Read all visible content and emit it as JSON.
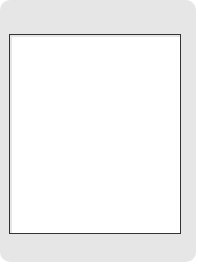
{
  "top_file_labels": [
    "1",
    "2",
    "3",
    "4",
    "5",
    "6",
    "7",
    "8",
    "9"
  ],
  "bottom_file_labels": [
    "九",
    "八",
    "七",
    "六",
    "五",
    "四",
    "三",
    "二",
    "一"
  ],
  "colors": {
    "black_piece": "#151515",
    "red_piece": "#7a7a7a",
    "frame": "#e6e6e6",
    "board": "#ffffff"
  },
  "pieces": [
    {
      "side": "black",
      "label": "将",
      "col": 4,
      "row": 0
    },
    {
      "side": "black",
      "label": "士",
      "col": 6,
      "row": 0
    },
    {
      "side": "black",
      "label": "炮",
      "col": 4,
      "row": 1
    },
    {
      "side": "black",
      "label": "士",
      "col": 5,
      "row": 1
    },
    {
      "side": "black",
      "label": "炮",
      "col": 6,
      "row": 1
    },
    {
      "side": "red",
      "label": "马",
      "col": 7,
      "row": 1
    },
    {
      "side": "black",
      "label": "车",
      "col": 2,
      "row": 2
    },
    {
      "side": "red",
      "label": "车",
      "col": 4,
      "row": 3
    },
    {
      "side": "red",
      "label": "车",
      "col": 5,
      "row": 3
    },
    {
      "side": "red",
      "label": "仕",
      "col": 5,
      "row": 8
    },
    {
      "side": "red",
      "label": "帅",
      "col": 5,
      "row": 9
    },
    {
      "side": "red",
      "label": "仕",
      "col": 6,
      "row": 9
    },
    {
      "side": "red",
      "label": "相",
      "col": 7,
      "row": 9
    }
  ],
  "caption": "第 1 题"
}
